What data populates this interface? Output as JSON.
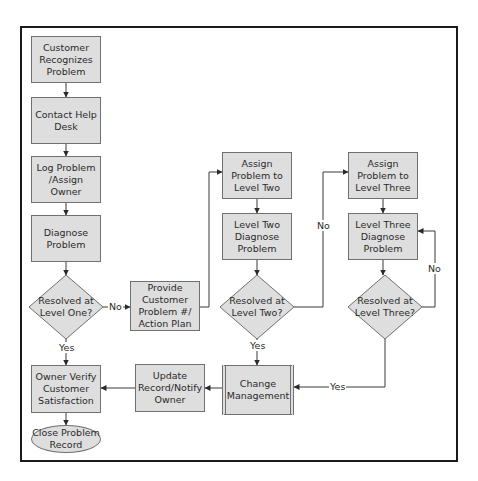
{
  "colors": {
    "node_fill": "#dedede",
    "node_border": "#707070",
    "line": "#3a3a3a",
    "frame": "#1a1a1a",
    "background": "#ffffff"
  },
  "nodes": [
    {
      "id": "recognize",
      "type": "process",
      "label": "Customer\nRecognizes\nProblem",
      "x": 31,
      "y": 36,
      "w": 70,
      "h": 47
    },
    {
      "id": "contact",
      "type": "process",
      "label": "Contact Help\nDesk",
      "x": 31,
      "y": 97,
      "w": 70,
      "h": 47
    },
    {
      "id": "log",
      "type": "process",
      "label": "Log Problem\n/Assign Owner",
      "x": 31,
      "y": 156,
      "w": 70,
      "h": 47
    },
    {
      "id": "diagnose",
      "type": "process",
      "label": "Diagnose\nProblem",
      "x": 31,
      "y": 215,
      "w": 70,
      "h": 47
    },
    {
      "id": "resolved1",
      "type": "decision",
      "label": "Resolved at\nLevel One?",
      "cx": 66,
      "cy": 307,
      "hw": 37,
      "hh": 32
    },
    {
      "id": "provide",
      "type": "process",
      "label": "Provide\nCustomer\nProblem #/\nAction Plan",
      "x": 130,
      "y": 281,
      "w": 70,
      "h": 50
    },
    {
      "id": "assign2",
      "type": "process",
      "label": "Assign\nProblem to\nLevel Two",
      "x": 222,
      "y": 152,
      "w": 70,
      "h": 47
    },
    {
      "id": "diag2",
      "type": "process",
      "label": "Level Two\nDiagnose\nProblem",
      "x": 222,
      "y": 213,
      "w": 70,
      "h": 47
    },
    {
      "id": "resolved2",
      "type": "decision",
      "label": "Resolved at\nLevel Two?",
      "cx": 257,
      "cy": 307,
      "hw": 37,
      "hh": 32
    },
    {
      "id": "assign3",
      "type": "process",
      "label": "Assign\nProblem to\nLevel Three",
      "x": 348,
      "y": 152,
      "w": 70,
      "h": 47
    },
    {
      "id": "diag3",
      "type": "process",
      "label": "Level Three\nDiagnose\nProblem",
      "x": 348,
      "y": 213,
      "w": 70,
      "h": 47
    },
    {
      "id": "resolved3",
      "type": "decision",
      "label": "Resolved at\nLevel Three?",
      "cx": 385,
      "cy": 307,
      "hw": 37,
      "hh": 32
    },
    {
      "id": "change",
      "type": "subprocess",
      "label": "Change\nManagement",
      "x": 222,
      "y": 365,
      "w": 72,
      "h": 50
    },
    {
      "id": "update",
      "type": "process",
      "label": "Update\nRecord/Notify\nOwner",
      "x": 135,
      "y": 364,
      "w": 70,
      "h": 48
    },
    {
      "id": "verify",
      "type": "process",
      "label": "Owner Verify\nCustomer\nSatisfaction",
      "x": 31,
      "y": 365,
      "w": 70,
      "h": 48
    },
    {
      "id": "close",
      "type": "terminal",
      "label": "Close Problem\nRecord",
      "x": 31,
      "y": 425,
      "w": 70,
      "h": 28
    }
  ],
  "edges": [
    {
      "points": [
        [
          66,
          83
        ],
        [
          66,
          97
        ]
      ]
    },
    {
      "points": [
        [
          66,
          144
        ],
        [
          66,
          156
        ]
      ]
    },
    {
      "points": [
        [
          66,
          203
        ],
        [
          66,
          215
        ]
      ]
    },
    {
      "points": [
        [
          66,
          262
        ],
        [
          66,
          275
        ]
      ]
    },
    {
      "points": [
        [
          103,
          307
        ],
        [
          130,
          307
        ]
      ],
      "label": "No",
      "lx": 108,
      "ly": 301
    },
    {
      "points": [
        [
          200,
          307
        ],
        [
          209,
          307
        ],
        [
          209,
          172
        ],
        [
          222,
          172
        ]
      ]
    },
    {
      "points": [
        [
          257,
          199
        ],
        [
          257,
          213
        ]
      ]
    },
    {
      "points": [
        [
          257,
          260
        ],
        [
          257,
          275
        ]
      ]
    },
    {
      "points": [
        [
          294,
          307
        ],
        [
          323,
          307
        ],
        [
          323,
          172
        ],
        [
          348,
          172
        ]
      ],
      "label": "No",
      "lx": 316,
      "ly": 220
    },
    {
      "points": [
        [
          383,
          199
        ],
        [
          383,
          213
        ]
      ]
    },
    {
      "points": [
        [
          383,
          260
        ],
        [
          383,
          275
        ]
      ]
    },
    {
      "points": [
        [
          422,
          307
        ],
        [
          435,
          307
        ],
        [
          435,
          231
        ],
        [
          418,
          231
        ]
      ],
      "label": "No",
      "lx": 427,
      "ly": 263
    },
    {
      "points": [
        [
          257,
          339
        ],
        [
          257,
          365
        ]
      ],
      "label": "Yes",
      "lx": 249,
      "ly": 340
    },
    {
      "points": [
        [
          385,
          339
        ],
        [
          385,
          387
        ],
        [
          294,
          387
        ]
      ],
      "label": "Yes",
      "lx": 329,
      "ly": 381
    },
    {
      "points": [
        [
          222,
          388
        ],
        [
          205,
          388
        ]
      ]
    },
    {
      "points": [
        [
          135,
          388
        ],
        [
          101,
          388
        ]
      ]
    },
    {
      "points": [
        [
          66,
          339
        ],
        [
          66,
          365
        ]
      ],
      "label": "Yes",
      "lx": 58,
      "ly": 342
    },
    {
      "points": [
        [
          66,
          413
        ],
        [
          66,
          425
        ]
      ]
    }
  ]
}
